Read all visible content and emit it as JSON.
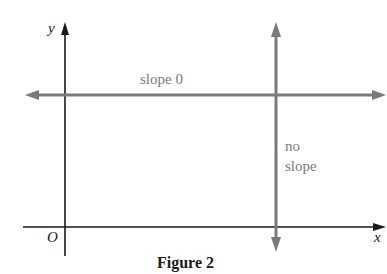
{
  "figure": {
    "caption": "Figure 2",
    "axes": {
      "x_label": "x",
      "y_label": "y",
      "origin_label": "O"
    },
    "lines": [
      {
        "label": "slope 0",
        "orientation": "horizontal",
        "color": "#7a7a7a"
      },
      {
        "label_line1": "no",
        "label_line2": "slope",
        "orientation": "vertical",
        "color": "#7a7a7a"
      }
    ],
    "colors": {
      "axis": "#1a1a1a",
      "lines": "#7a7a7a"
    }
  }
}
